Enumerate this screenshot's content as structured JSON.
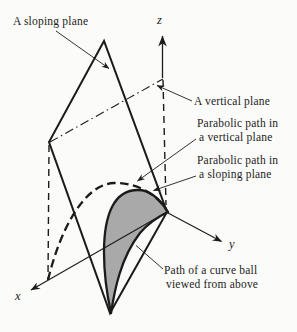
{
  "figure": {
    "title_hint": "3D diagram of a curve ball trajectory",
    "labels": {
      "sloping_plane": "A sloping plane",
      "vertical_plane": "A vertical plane",
      "parabolic_vertical": {
        "line1": "Parabolic path in",
        "line2": "a vertical plane"
      },
      "parabolic_sloping": {
        "line1": "Parabolic path in",
        "line2": "a sloping plane"
      },
      "curve_ball": {
        "line1": "Path of a curve ball",
        "line2": "viewed from above"
      },
      "axes": {
        "x": "x",
        "y": "y",
        "z": "z"
      }
    },
    "colors": {
      "line": "#1b1b1b",
      "shaded_region": "#a9a9a9",
      "background": "#fbfbf9"
    }
  }
}
